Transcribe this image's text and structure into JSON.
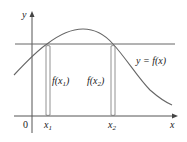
{
  "figure": {
    "axes": {
      "x_label": "x",
      "y_label": "y",
      "origin_label": "0"
    },
    "curve_label": "y = f(x)",
    "points": [
      {
        "label_base": "x",
        "label_sub": "1",
        "value_label_base": "f(x",
        "value_label_sub": "1",
        "value_label_close": ")"
      },
      {
        "label_base": "x",
        "label_sub": "2",
        "value_label_base": "f(x",
        "value_label_sub": "2",
        "value_label_close": ")"
      }
    ],
    "colors": {
      "axis": "#555555",
      "curve": "#666666",
      "horizontal_line": "#666666",
      "bracket": "#777777",
      "text": "#222222"
    }
  }
}
